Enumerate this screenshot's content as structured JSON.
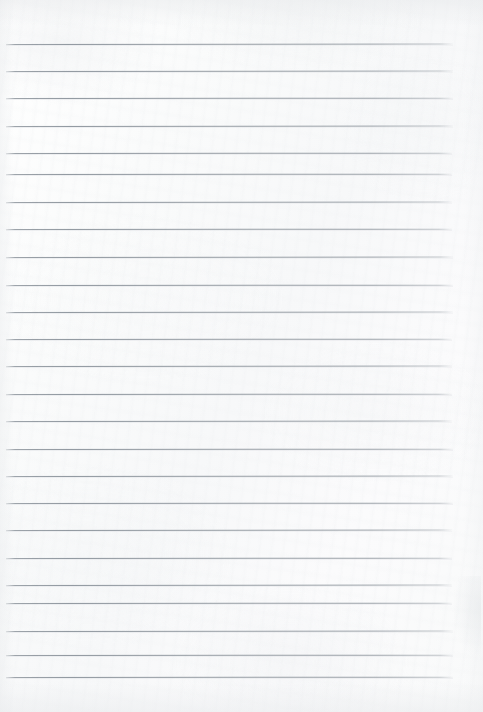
{
  "document": {
    "kind": "lined-notebook-paper-scan",
    "title": "Blank lined paper",
    "visible_text": "",
    "written_content": []
  },
  "page": {
    "width": 483,
    "height": 712,
    "background_color": "#fbfbfc",
    "paper_tone": "#f8f9fa"
  },
  "ruling": {
    "line_color": "#939aa2",
    "line_thickness_px": 1,
    "line_count": 24,
    "line_spacing_px": 27.5,
    "first_line_y": 44,
    "last_line_y": 677,
    "left_margin_x": 6,
    "right_margin_x": 453,
    "line_length_px": 447,
    "has_vertical_margin_rule": false,
    "has_holes": false,
    "lines": [
      {
        "index": 1,
        "y": 44,
        "x1": 6,
        "x2": 453,
        "tilt_deg": -0.05
      },
      {
        "index": 2,
        "y": 71,
        "x1": 6,
        "x2": 453,
        "tilt_deg": -0.05
      },
      {
        "index": 3,
        "y": 98,
        "x1": 6,
        "x2": 453,
        "tilt_deg": -0.04
      },
      {
        "index": 4,
        "y": 126,
        "x1": 6,
        "x2": 453,
        "tilt_deg": -0.05
      },
      {
        "index": 5,
        "y": 153,
        "x1": 6,
        "x2": 452,
        "tilt_deg": -0.04
      },
      {
        "index": 6,
        "y": 174,
        "x1": 6,
        "x2": 452,
        "tilt_deg": -0.04
      },
      {
        "index": 7,
        "y": 202,
        "x1": 6,
        "x2": 452,
        "tilt_deg": -0.05
      },
      {
        "index": 8,
        "y": 229,
        "x1": 6,
        "x2": 452,
        "tilt_deg": -0.04
      },
      {
        "index": 9,
        "y": 257,
        "x1": 6,
        "x2": 453,
        "tilt_deg": -0.05
      },
      {
        "index": 10,
        "y": 285,
        "x1": 6,
        "x2": 453,
        "tilt_deg": -0.04
      },
      {
        "index": 11,
        "y": 312,
        "x1": 6,
        "x2": 453,
        "tilt_deg": -0.05
      },
      {
        "index": 12,
        "y": 339,
        "x1": 6,
        "x2": 452,
        "tilt_deg": -0.04
      },
      {
        "index": 13,
        "y": 366,
        "x1": 6,
        "x2": 452,
        "tilt_deg": -0.05
      },
      {
        "index": 14,
        "y": 394,
        "x1": 6,
        "x2": 452,
        "tilt_deg": -0.04
      },
      {
        "index": 15,
        "y": 421,
        "x1": 6,
        "x2": 452,
        "tilt_deg": -0.05
      },
      {
        "index": 16,
        "y": 449,
        "x1": 6,
        "x2": 453,
        "tilt_deg": -0.04
      },
      {
        "index": 17,
        "y": 476,
        "x1": 6,
        "x2": 453,
        "tilt_deg": -0.05
      },
      {
        "index": 18,
        "y": 503,
        "x1": 6,
        "x2": 453,
        "tilt_deg": -0.04
      },
      {
        "index": 19,
        "y": 530,
        "x1": 6,
        "x2": 452,
        "tilt_deg": -0.05
      },
      {
        "index": 20,
        "y": 558,
        "x1": 6,
        "x2": 452,
        "tilt_deg": -0.04
      },
      {
        "index": 21,
        "y": 585,
        "x1": 6,
        "x2": 452,
        "tilt_deg": -0.05
      },
      {
        "index": 22,
        "y": 603,
        "x1": 6,
        "x2": 452,
        "tilt_deg": -0.04
      },
      {
        "index": 23,
        "y": 631,
        "x1": 6,
        "x2": 453,
        "tilt_deg": -0.05
      },
      {
        "index": 24,
        "y": 655,
        "x1": 6,
        "x2": 453,
        "tilt_deg": -0.04
      },
      {
        "index": 25,
        "y": 677,
        "x1": 6,
        "x2": 453,
        "tilt_deg": -0.04
      }
    ]
  }
}
